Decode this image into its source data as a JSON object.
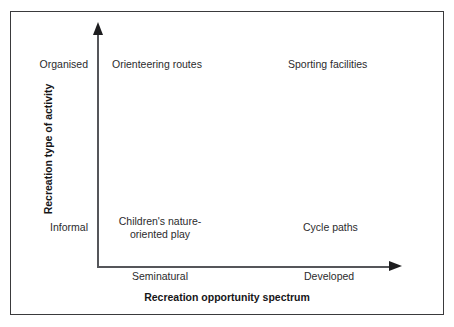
{
  "figure": {
    "kind": "two-axis conceptual quadrant diagram",
    "background_color": "#ffffff",
    "frame_color": "#3a3a3c",
    "axis_color": "#55565a",
    "text_color": "#2b2b2d"
  },
  "axes": {
    "x": {
      "title": "Recreation opportunity spectrum",
      "tick_labels": [
        "Seminatural",
        "Developed"
      ],
      "arrow": "right-arrowhead"
    },
    "y": {
      "title": "Recreation type of activity",
      "tick_labels": [
        "Organised",
        "Informal"
      ],
      "arrow": "up-arrowhead"
    }
  },
  "chart_data": {
    "type": "scatter",
    "title": "",
    "xlabel": "Recreation opportunity spectrum",
    "ylabel": "Recreation type of activity",
    "x_tick_labels": [
      "Seminatural",
      "Developed"
    ],
    "y_tick_labels": [
      "Informal",
      "Organised"
    ],
    "grid": false,
    "legend": "none",
    "points": [
      {
        "label": "Orienteering routes",
        "x": "Seminatural",
        "y": "Organised"
      },
      {
        "label": "Sporting facilities",
        "x": "Developed",
        "y": "Organised"
      },
      {
        "label": "Children's nature-oriented play",
        "x": "Seminatural",
        "y": "Informal"
      },
      {
        "label": "Cycle paths",
        "x": "Developed",
        "y": "Informal"
      }
    ]
  },
  "labels": {
    "y_organised": "Organised",
    "y_informal": "Informal",
    "x_seminatural": "Seminatural",
    "x_developed": "Developed",
    "quadrant_top_left": "Orienteering routes",
    "quadrant_top_right": "Sporting facilities",
    "quadrant_bottom_left": "Children's nature-oriented play",
    "quadrant_bottom_right": "Cycle paths",
    "x_axis_title": "Recreation opportunity spectrum",
    "y_axis_title": "Recreation type of activity"
  }
}
